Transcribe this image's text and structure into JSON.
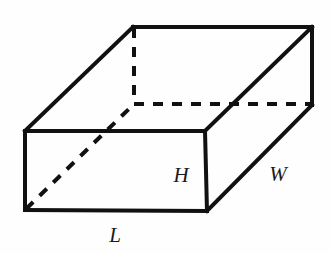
{
  "figure": {
    "name": "rectangular-prism",
    "background_color": "#fefefe",
    "stroke_color": "#111111",
    "label_color": "#1a1a1a",
    "canvas": {
      "width": 331,
      "height": 254
    }
  },
  "geometry": {
    "vertices": {
      "front_top_left": {
        "x": 25,
        "y": 131
      },
      "front_top_right": {
        "x": 205,
        "y": 131
      },
      "front_bottom_left": {
        "x": 25,
        "y": 210
      },
      "front_bottom_right": {
        "x": 207,
        "y": 211
      },
      "back_top_left": {
        "x": 133,
        "y": 27
      },
      "back_top_right": {
        "x": 312,
        "y": 27
      },
      "back_bottom_left": {
        "x": 134,
        "y": 104
      },
      "back_bottom_right": {
        "x": 312,
        "y": 105
      }
    },
    "solid_edges": [
      {
        "name": "front-face-top",
        "d": "M 25 131 L 205 131"
      },
      {
        "name": "front-face-left",
        "d": "M 25 131 L 25 210"
      },
      {
        "name": "front-face-bottom",
        "d": "M 25 210 L 207 211"
      },
      {
        "name": "front-face-right",
        "d": "M 205 131 L 207 211"
      },
      {
        "name": "top-face-back",
        "d": "M 133 27 L 312 27"
      },
      {
        "name": "top-face-left",
        "d": "M 25 131 L 133 27"
      },
      {
        "name": "top-face-right",
        "d": "M 205 131 L 312 27"
      },
      {
        "name": "right-face-back",
        "d": "M 312 27 L 312 105"
      },
      {
        "name": "right-face-bottom",
        "d": "M 207 211 L 312 105"
      }
    ],
    "dashed_edges": [
      {
        "name": "hidden-vertical-back-left",
        "d": "M 134 28 L 134 104"
      },
      {
        "name": "hidden-horizontal-back",
        "d": "M 134 104 L 312 104"
      },
      {
        "name": "hidden-diagonal-front-inner",
        "d": "M 26 209 L 134 104"
      }
    ],
    "stroke_width_solid": 4,
    "stroke_width_dashed": 4,
    "dash_pattern": "10 9"
  },
  "labels": {
    "height": {
      "text": "H",
      "x": 181,
      "y": 175
    },
    "width": {
      "text": "W",
      "x": 278,
      "y": 174
    },
    "length": {
      "text": "L",
      "x": 115,
      "y": 235
    }
  }
}
